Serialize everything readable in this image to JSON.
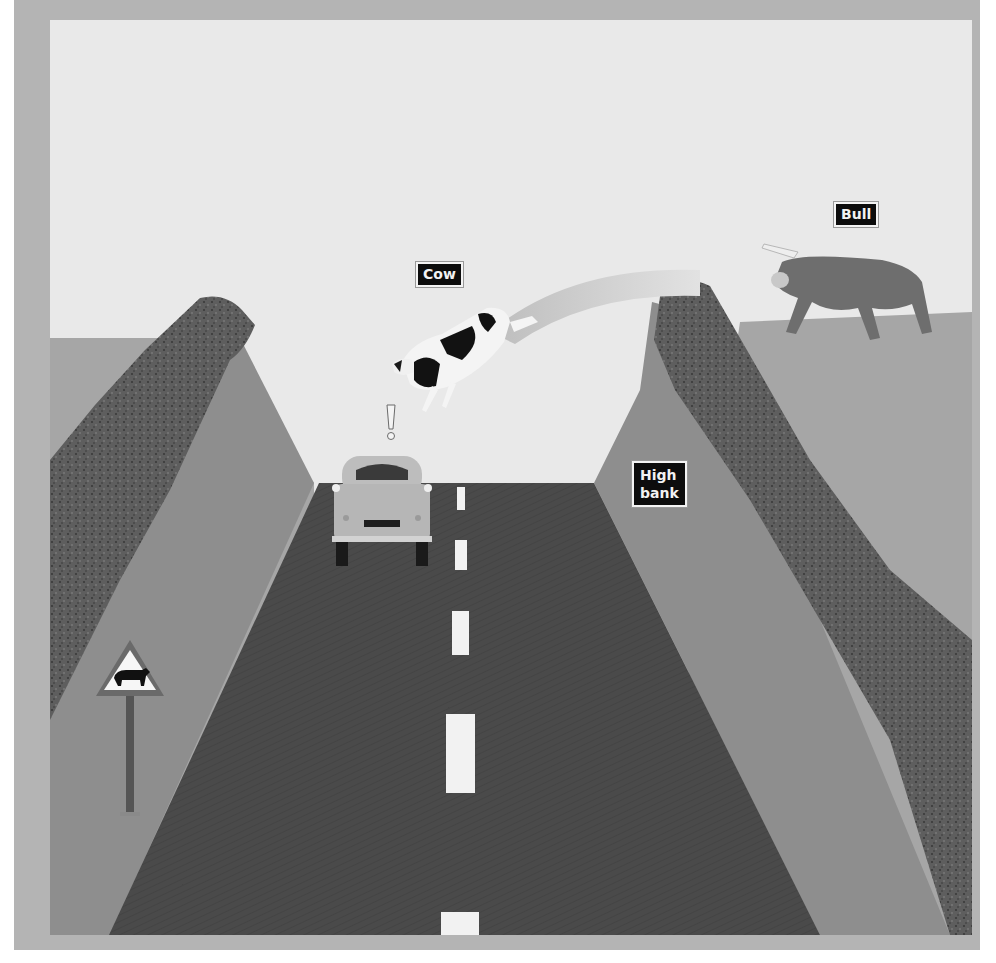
{
  "figure": {
    "type": "illustration",
    "labels": {
      "cow": "Cow",
      "bull": "Bull",
      "high_bank": "High bank"
    },
    "high_bank_lines": [
      "High",
      "bank"
    ],
    "exclamation": "!",
    "sign": {
      "shape": "triangle",
      "symbol": "cow-silhouette"
    },
    "road": {
      "center_dashes": 5
    },
    "colors": {
      "frame": "#b4b4b4",
      "sky": "#e9e9e9",
      "road": "#4a4a4a",
      "bank_face": "#8e8e8e",
      "bank_far": "#a6a6a6",
      "rock": "#606060",
      "label_bg": "#0d0d0d",
      "label_text": "#f2f2f2",
      "dash": "#f2f2f2",
      "car": "#bdbdbd",
      "bull": "#6e6e6e",
      "arc": "#c2c2c2"
    }
  }
}
